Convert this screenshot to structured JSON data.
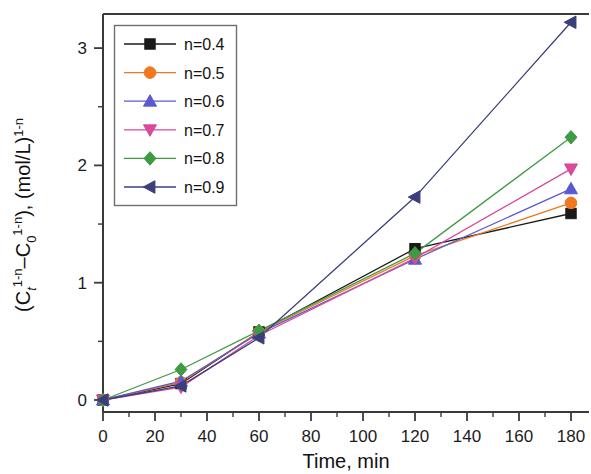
{
  "chart_data": {
    "type": "line",
    "title": "",
    "xlabel": "Time, min",
    "ylabel": "(Ct1-n–C01-n), (mol/L)1-n",
    "ylabel_parts": {
      "open": "(C",
      "sub_t": "t",
      "sup_1n_a": "1-n",
      "dash": "–C",
      "sub_0": "0",
      "sup_1n_b": "1-n",
      "close": "), (mol/L)",
      "sup_1n_c": "1-n"
    },
    "x": [
      0,
      30,
      60,
      120,
      180
    ],
    "xlim": [
      -5,
      188
    ],
    "ylim": [
      -0.28,
      3.38
    ],
    "xticks": [
      0,
      20,
      40,
      60,
      80,
      100,
      120,
      140,
      160,
      180
    ],
    "xticklabels": [
      "0",
      "20",
      "40",
      "60",
      "80",
      "100",
      "120",
      "140",
      "160",
      "180"
    ],
    "xminorticks": [
      10,
      30,
      50,
      70,
      90,
      110,
      130,
      150,
      170
    ],
    "yticks": [
      0,
      1,
      2,
      3
    ],
    "yticklabels": [
      "0",
      "1",
      "2",
      "3"
    ],
    "yminorticks": [
      0.5,
      1.5,
      2.5
    ],
    "grid": false,
    "legend_position": "upper-left-inside",
    "series": [
      {
        "name": "n=0.4",
        "label": "n=0.4",
        "color": "#1a1a1a",
        "marker": "square",
        "values": [
          0.0,
          0.14,
          0.58,
          1.29,
          1.59
        ]
      },
      {
        "name": "n=0.5",
        "label": "n=0.5",
        "color": "#f07820",
        "marker": "circle",
        "values": [
          0.0,
          0.15,
          0.58,
          1.23,
          1.68
        ]
      },
      {
        "name": "n=0.6",
        "label": "n=0.6",
        "color": "#5a5ad0",
        "marker": "triangle-up",
        "values": [
          0.0,
          0.16,
          0.57,
          1.2,
          1.8
        ]
      },
      {
        "name": "n=0.7",
        "label": "n=0.7",
        "color": "#d84a9a",
        "marker": "triangle-down",
        "values": [
          0.0,
          0.11,
          0.55,
          1.21,
          1.97
        ]
      },
      {
        "name": "n=0.8",
        "label": "n=0.8",
        "color": "#3f9a44",
        "marker": "diamond",
        "values": [
          0.0,
          0.26,
          0.59,
          1.25,
          2.24
        ]
      },
      {
        "name": "n=0.9",
        "label": "n=0.9",
        "color": "#3a3f7a",
        "marker": "triangle-left",
        "values": [
          0.0,
          0.12,
          0.53,
          1.73,
          3.22
        ]
      }
    ]
  },
  "figure": {
    "background": "#ffffff",
    "axis_color": "#3a3a3c",
    "frame_left": 103,
    "frame_right": 585,
    "frame_top": 14,
    "frame_bottom": 412
  }
}
